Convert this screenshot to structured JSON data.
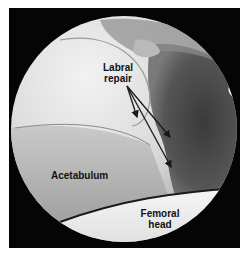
{
  "image": {
    "description": "Arthroscopic view of hip joint showing labral repair",
    "colors": {
      "frame": "#050505",
      "background": "#ffffff",
      "label_text": "#111111",
      "arrow": "#1a1a1a"
    }
  },
  "labels": {
    "labral_repair_line1": "Labral",
    "labral_repair_line2": "repair",
    "acetabulum": "Acetabulum",
    "femoral_head_line1": "Femoral",
    "femoral_head_line2": "head"
  },
  "annotations": {
    "arrow_count": 3,
    "arrow_origin": [
      127,
      86
    ],
    "arrow_targets": [
      [
        137,
        118
      ],
      [
        171,
        138
      ],
      [
        172,
        168
      ]
    ]
  }
}
